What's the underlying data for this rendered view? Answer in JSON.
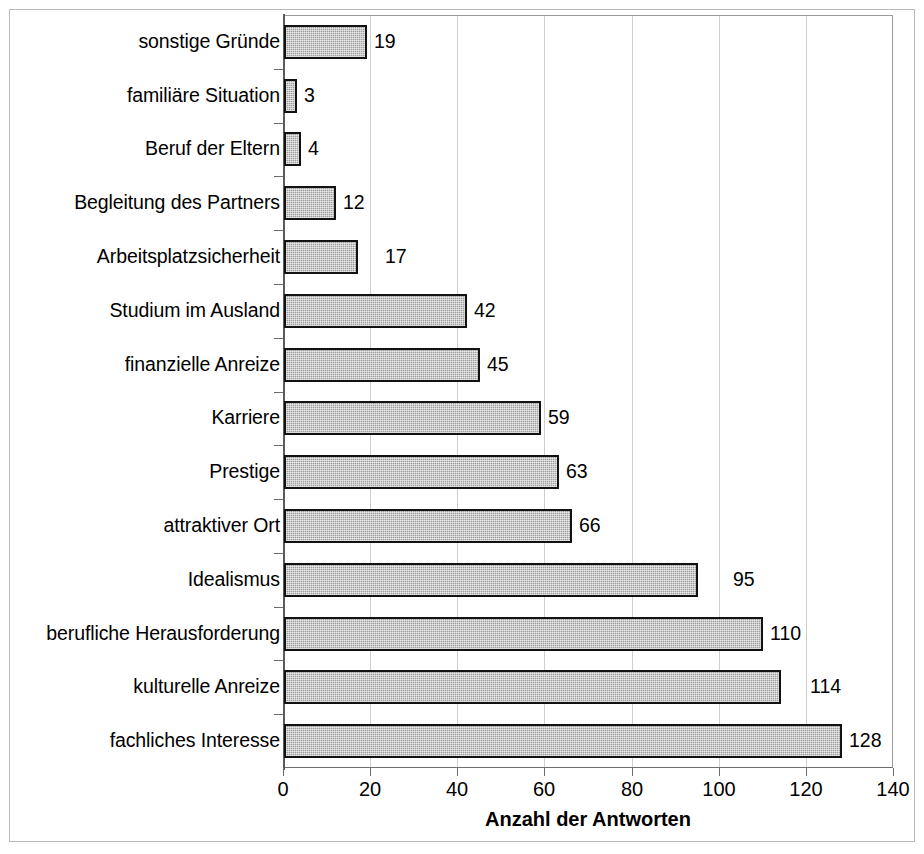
{
  "chart_data": {
    "type": "bar",
    "orientation": "horizontal",
    "title": "",
    "xlabel": "Anzahl der Antworten",
    "ylabel": "",
    "xlim": [
      0,
      140
    ],
    "xticks": [
      0,
      20,
      40,
      60,
      80,
      100,
      120,
      140
    ],
    "grid": "vertical",
    "legend": "none",
    "categories": [
      "sonstige Gründe",
      "familiäre Situation",
      "Beruf der Eltern",
      "Begleitung des Partners",
      "Arbeitsplatzsicherheit",
      "Studium im Ausland",
      "finanzielle Anreize",
      "Karriere",
      "Prestige",
      "attraktiver Ort",
      "Idealismus",
      "berufliche Herausforderung",
      "kulturelle Anreize",
      "fachliches Interesse"
    ],
    "values": [
      19,
      3,
      4,
      12,
      17,
      42,
      45,
      59,
      63,
      66,
      95,
      110,
      114,
      128
    ],
    "value_labels": [
      "19",
      "3",
      "4",
      "12",
      "17",
      "42",
      "45",
      "59",
      "63",
      "66",
      "95",
      "110",
      "114",
      "128"
    ],
    "colors": {
      "bar_fill": "#9e9e9e",
      "bar_border": "#121212",
      "gridline": "#cfcfcf",
      "axis": "#5a5a5a",
      "text": "#000000",
      "background": "#ffffff",
      "frame": "#b9b9b9"
    }
  }
}
